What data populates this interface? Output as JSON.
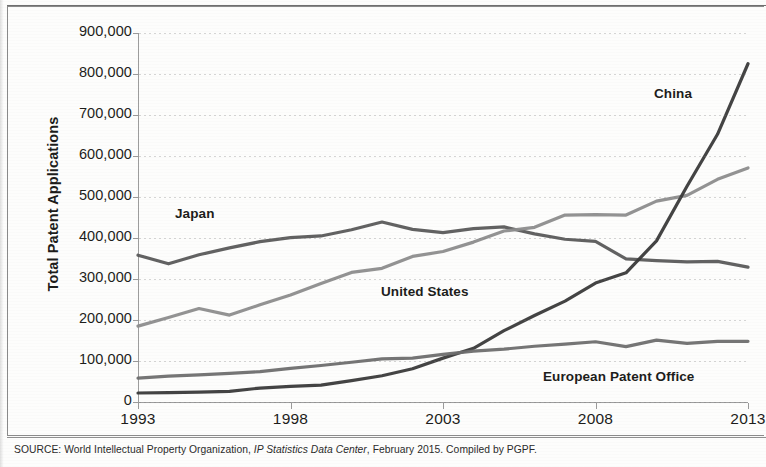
{
  "figure": {
    "source_prefix": "SOURCE: World Intellectual Property Organization, ",
    "source_italic": "IP Statistics Data Center",
    "source_suffix": ", February 2015. Compiled by PGPF."
  },
  "chart_data": {
    "type": "line",
    "title": "",
    "xlabel": "",
    "ylabel": "Total Patent Applications",
    "xlim": [
      1993,
      2013
    ],
    "ylim": [
      0,
      900000
    ],
    "grid": true,
    "legend": "inline-labels",
    "x": [
      1993,
      1994,
      1995,
      1996,
      1997,
      1998,
      1999,
      2000,
      2001,
      2002,
      2003,
      2004,
      2005,
      2006,
      2007,
      2008,
      2009,
      2010,
      2011,
      2012,
      2013
    ],
    "xticks": [
      "1993",
      "1998",
      "2003",
      "2008",
      "2013"
    ],
    "yticks": [
      "0",
      "100,000",
      "200,000",
      "300,000",
      "400,000",
      "500,000",
      "600,000",
      "700,000",
      "800,000",
      "900,000"
    ],
    "series": [
      {
        "name": "Japan",
        "color": "#5a5a5a",
        "label_x": 175,
        "label_y": 206,
        "values": [
          358000,
          337000,
          359000,
          376000,
          391000,
          401000,
          405000,
          420000,
          439000,
          421000,
          413000,
          423000,
          427000,
          410000,
          397000,
          392000,
          349000,
          345000,
          342000,
          343000,
          329000
        ]
      },
      {
        "name": "United States",
        "color": "#8d8d8d",
        "label_x": 381,
        "label_y": 284,
        "values": [
          185000,
          206000,
          228000,
          212000,
          237000,
          261000,
          289000,
          316000,
          326000,
          355000,
          367000,
          390000,
          417000,
          426000,
          456000,
          457000,
          456000,
          490000,
          504000,
          543000,
          571000
        ]
      },
      {
        "name": "China",
        "color": "#3a3a3a",
        "label_x": 654,
        "label_y": 86,
        "values": [
          22000,
          23000,
          24000,
          26000,
          34000,
          38000,
          41000,
          52000,
          64000,
          81000,
          107000,
          131000,
          174000,
          211000,
          246000,
          290000,
          315000,
          393000,
          526000,
          653000,
          825000
        ]
      },
      {
        "name": "European Patent Office",
        "color": "#6e6e6e",
        "label_x": 543,
        "label_y": 369,
        "values": [
          58000,
          63000,
          66000,
          70000,
          74000,
          82000,
          89000,
          97000,
          105000,
          107000,
          116000,
          124000,
          129000,
          136000,
          141000,
          147000,
          135000,
          151000,
          143000,
          148000,
          148000
        ]
      }
    ]
  }
}
